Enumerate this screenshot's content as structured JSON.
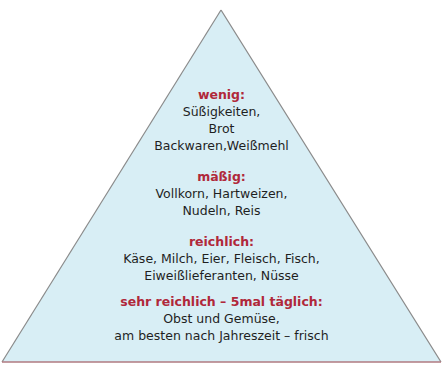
{
  "diagram": {
    "shape": "triangle",
    "fill": "#d8eef5",
    "edge_color": "#8a8a8a",
    "base_color": "#b07a80",
    "heading_color": "#b0283a"
  },
  "levels": [
    {
      "heading": "wenig",
      "sep": ":",
      "lines": [
        "Süßigkeiten,",
        "Brot",
        "Backwaren,Weißmehl"
      ]
    },
    {
      "heading": "mäßig:",
      "sep": "",
      "lines": [
        "Vollkorn, Hartweizen,",
        "Nudeln, Reis"
      ]
    },
    {
      "heading": "reichlich",
      "sep": ":",
      "lines": [
        "Käse, Milch, Eier, Fleisch, Fisch,",
        "Eiweißlieferanten, Nüsse"
      ]
    },
    {
      "heading": "sehr reichlich – 5mal täglich",
      "sep": ":",
      "lines": [
        "Obst und Gemüse,",
        "am besten nach Jahreszeit – frisch"
      ]
    }
  ]
}
